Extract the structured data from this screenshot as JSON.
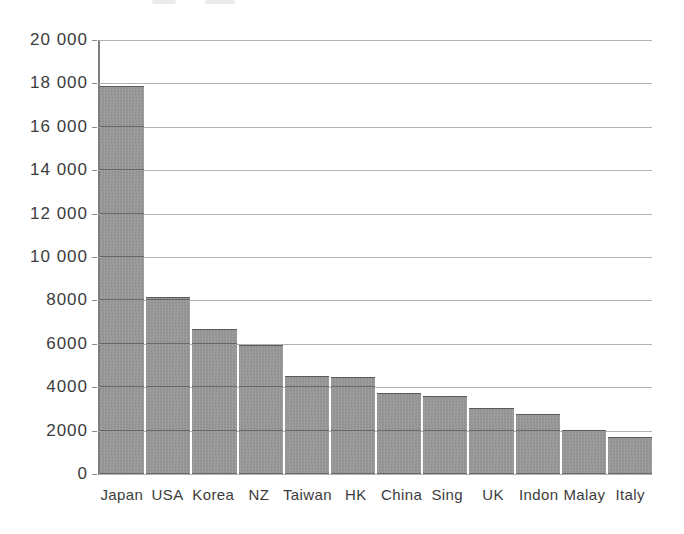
{
  "colors": {
    "bar_fill": "#989898",
    "bar_texture_light": "#9e9e9e",
    "bar_texture_dark": "#8f8f8f",
    "gridline": "#b3b3b3",
    "axis_line": "#7e7e7e",
    "text": "#3c3c3c",
    "background": "#ffffff"
  },
  "chart_data": {
    "type": "bar",
    "title": "",
    "xlabel": "",
    "ylabel": "",
    "categories": [
      "Japan",
      "USA",
      "Korea",
      "NZ",
      "Taiwan",
      "HK",
      "China",
      "Sing",
      "UK",
      "Indon",
      "Malay",
      "Italy"
    ],
    "values": [
      17900,
      8150,
      6700,
      5950,
      4500,
      4450,
      3750,
      3600,
      3050,
      2750,
      2050,
      1700
    ],
    "ylim": [
      0,
      20000
    ],
    "ytick_interval": 2000,
    "ytick_labels_top_to_bottom": [
      "20 000",
      "18 000",
      "16 000",
      "14 000",
      "12 000",
      "10 000",
      "8000",
      "6000",
      "4000",
      "2000",
      "0"
    ],
    "grid": true,
    "legend_position": "none",
    "bar_gap_px": 2,
    "single_series": true
  }
}
